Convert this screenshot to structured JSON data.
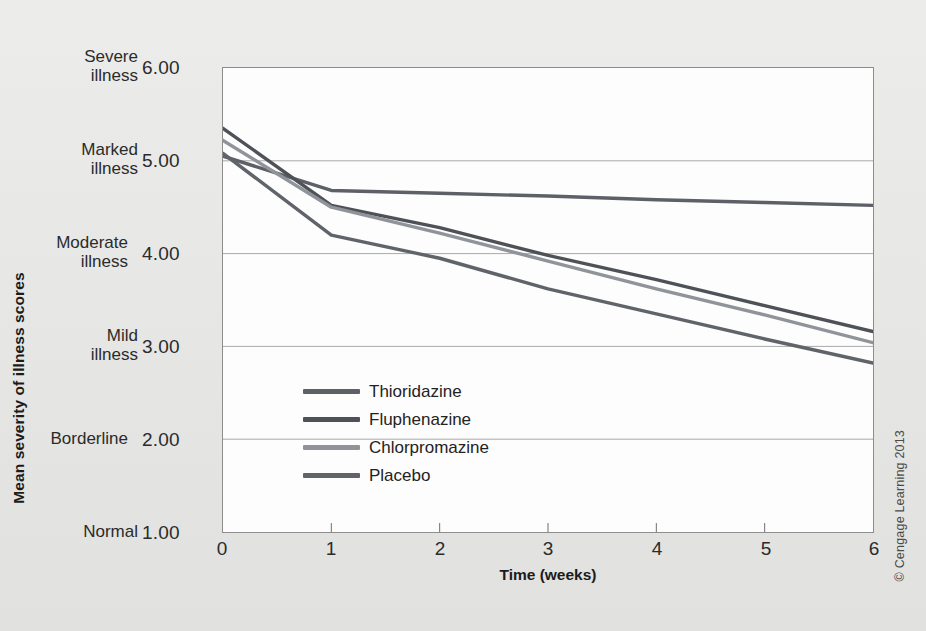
{
  "credit": "© Cengage Learning 2013",
  "chart_data": {
    "type": "line",
    "title": "",
    "xlabel": "Time (weeks)",
    "ylabel": "Mean severity of illness scores",
    "x": [
      0,
      1,
      2,
      3,
      4,
      5,
      6
    ],
    "xlim": [
      0,
      6
    ],
    "ylim": [
      1.0,
      6.0
    ],
    "grid": true,
    "grid_axis": "y",
    "legend_position": "inside-lower-left",
    "xticks": [
      "0",
      "1",
      "2",
      "3",
      "4",
      "5",
      "6"
    ],
    "yticks": [
      "1.00",
      "2.00",
      "3.00",
      "4.00",
      "5.00",
      "6.00"
    ],
    "ytick_categories": [
      "Normal",
      "Borderline",
      "Mild\nillness",
      "Moderate\nillness",
      "Marked\nillness",
      "Severe\nillness"
    ],
    "y_category_labels": [
      {
        "value": "6.00",
        "word_line1": "Severe",
        "word_line2": "illness"
      },
      {
        "value": "5.00",
        "word_line1": "Marked",
        "word_line2": "illness"
      },
      {
        "value": "4.00",
        "word_line1": "Moderate",
        "word_line2": "illness"
      },
      {
        "value": "3.00",
        "word_line1": "Mild",
        "word_line2": "illness"
      },
      {
        "value": "2.00",
        "word_line1": "Borderline",
        "word_line2": ""
      },
      {
        "value": "1.00",
        "word_line1": "Normal",
        "word_line2": ""
      }
    ],
    "series": [
      {
        "name": "Thioridazine",
        "color": "#5d6066",
        "points": [
          {
            "x": 0,
            "y": 5.05
          },
          {
            "x": 1,
            "y": 4.68
          },
          {
            "x": 2,
            "y": 4.65
          },
          {
            "x": 3,
            "y": 4.62
          },
          {
            "x": 4,
            "y": 4.58
          },
          {
            "x": 5,
            "y": 4.55
          },
          {
            "x": 6,
            "y": 4.52
          }
        ],
        "values": [
          5.05,
          4.68,
          4.65,
          4.62,
          4.58,
          4.55,
          4.52
        ]
      },
      {
        "name": "Fluphenazine",
        "color": "#4e5258",
        "points": [
          {
            "x": 0,
            "y": 5.35
          },
          {
            "x": 1,
            "y": 4.52
          },
          {
            "x": 2,
            "y": 4.28
          },
          {
            "x": 3,
            "y": 3.98
          },
          {
            "x": 4,
            "y": 3.72
          },
          {
            "x": 5,
            "y": 3.44
          },
          {
            "x": 6,
            "y": 3.16
          }
        ],
        "values": [
          5.35,
          4.52,
          4.28,
          3.98,
          3.72,
          3.44,
          3.16
        ]
      },
      {
        "name": "Chlorpromazine",
        "color": "#90949a",
        "points": [
          {
            "x": 0,
            "y": 5.22
          },
          {
            "x": 1,
            "y": 4.5
          },
          {
            "x": 2,
            "y": 4.22
          },
          {
            "x": 3,
            "y": 3.92
          },
          {
            "x": 4,
            "y": 3.62
          },
          {
            "x": 5,
            "y": 3.34
          },
          {
            "x": 6,
            "y": 3.04
          }
        ],
        "values": [
          5.22,
          4.5,
          4.22,
          3.92,
          3.62,
          3.34,
          3.04
        ]
      },
      {
        "name": "Placebo",
        "color": "#60646a",
        "points": [
          {
            "x": 0,
            "y": 5.08
          },
          {
            "x": 1,
            "y": 4.2
          },
          {
            "x": 2,
            "y": 3.95
          },
          {
            "x": 3,
            "y": 3.62
          },
          {
            "x": 4,
            "y": 3.35
          },
          {
            "x": 5,
            "y": 3.08
          },
          {
            "x": 6,
            "y": 2.82
          }
        ],
        "values": [
          5.08,
          4.2,
          3.95,
          3.62,
          3.35,
          3.08,
          2.82
        ]
      }
    ],
    "legend": [
      {
        "label": "Thioridazine",
        "color": "#5d6066"
      },
      {
        "label": "Fluphenazine",
        "color": "#4e5258"
      },
      {
        "label": "Chlorpromazine",
        "color": "#90949a"
      },
      {
        "label": "Placebo",
        "color": "#60646a"
      }
    ]
  }
}
